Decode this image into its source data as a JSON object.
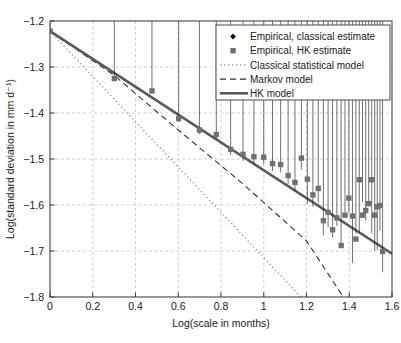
{
  "chart_data": {
    "type": "scatter",
    "title": "",
    "xlabel": "Log(scale in months)",
    "ylabel": "Log(standard deviation in mm d⁻¹)",
    "xlim": [
      0,
      1.6
    ],
    "ylim": [
      -1.8,
      -1.2
    ],
    "xticks": [
      "0",
      "0.2",
      "0.4",
      "0.6",
      "0.8",
      "1",
      "1.2",
      "1.4",
      "1.6"
    ],
    "xtick_values": [
      0,
      0.2,
      0.4,
      0.6,
      0.8,
      1.0,
      1.2,
      1.4,
      1.6
    ],
    "yticks": [
      "−1.2",
      "−1.3",
      "−1.4",
      "−1.5",
      "−1.6",
      "−1.7",
      "−1.8"
    ],
    "ytick_values": [
      -1.2,
      -1.3,
      -1.4,
      -1.5,
      -1.6,
      -1.7,
      -1.8
    ],
    "grid": true,
    "grid_style": "dashed",
    "grid_color": "#c8c8c8",
    "legend_position": "top-right",
    "series": [
      {
        "name": "Empirical, classical estimate",
        "type": "scatter",
        "marker": "diamond",
        "color": "#111111",
        "points": [
          [
            0.0,
            -1.222
          ],
          [
            0.301,
            -1.331
          ],
          [
            0.477,
            -1.362
          ],
          [
            0.602,
            -1.426
          ],
          [
            0.699,
            -1.453
          ],
          [
            0.778,
            -1.463
          ],
          [
            0.845,
            -1.498
          ],
          [
            0.903,
            -1.511
          ],
          [
            0.954,
            -1.517
          ],
          [
            1.0,
            -1.519
          ],
          [
            1.041,
            -1.533
          ],
          [
            1.079,
            -1.536
          ],
          [
            1.114,
            -1.561
          ],
          [
            1.146,
            -1.577
          ],
          [
            1.176,
            -1.53
          ],
          [
            1.204,
            -1.604
          ],
          [
            1.23,
            -1.611
          ],
          [
            1.255,
            -1.601
          ],
          [
            1.279,
            -1.673
          ],
          [
            1.301,
            -1.655
          ],
          [
            1.322,
            -1.677
          ],
          [
            1.342,
            -1.652
          ],
          [
            1.362,
            -1.695
          ],
          [
            1.38,
            -1.622
          ],
          [
            1.398,
            -1.624
          ],
          [
            1.415,
            -1.733
          ],
          [
            1.431,
            -1.668
          ],
          [
            1.447,
            -1.668
          ],
          [
            1.462,
            -1.599
          ],
          [
            1.477,
            -1.64
          ],
          [
            1.491,
            -1.598
          ],
          [
            1.505,
            -1.668
          ],
          [
            1.519,
            -1.707
          ],
          [
            1.531,
            -1.704
          ],
          [
            1.544,
            -1.663
          ],
          [
            1.556,
            -1.753
          ]
        ]
      },
      {
        "name": "Empirical, HK estimate",
        "type": "scatter",
        "marker": "square",
        "color": "#707070",
        "points": [
          [
            0.0,
            -1.222
          ],
          [
            0.301,
            -1.325
          ],
          [
            0.477,
            -1.352
          ],
          [
            0.602,
            -1.412
          ],
          [
            0.699,
            -1.437
          ],
          [
            0.778,
            -1.447
          ],
          [
            0.845,
            -1.479
          ],
          [
            0.903,
            -1.49
          ],
          [
            0.954,
            -1.495
          ],
          [
            1.0,
            -1.496
          ],
          [
            1.041,
            -1.51
          ],
          [
            1.079,
            -1.512
          ],
          [
            1.114,
            -1.536
          ],
          [
            1.146,
            -1.551
          ],
          [
            1.176,
            -1.498
          ],
          [
            1.204,
            -1.544
          ],
          [
            1.23,
            -1.578
          ],
          [
            1.255,
            -1.564
          ],
          [
            1.279,
            -1.634
          ],
          [
            1.301,
            -1.616
          ],
          [
            1.322,
            -1.654
          ],
          [
            1.342,
            -1.628
          ],
          [
            1.362,
            -1.688
          ],
          [
            1.38,
            -1.622
          ],
          [
            1.398,
            -1.585
          ],
          [
            1.415,
            -1.624
          ],
          [
            1.431,
            -1.674
          ],
          [
            1.447,
            -1.545
          ],
          [
            1.462,
            -1.622
          ],
          [
            1.477,
            -1.612
          ],
          [
            1.491,
            -1.597
          ],
          [
            1.505,
            -1.545
          ],
          [
            1.519,
            -1.622
          ],
          [
            1.531,
            -1.604
          ],
          [
            1.544,
            -1.601
          ],
          [
            1.556,
            -1.701
          ]
        ]
      },
      {
        "name": "Classical statistical model",
        "type": "line",
        "style": "dotted",
        "color": "#999999",
        "points": [
          [
            0.0,
            -1.222
          ],
          [
            1.174,
            -1.8
          ]
        ]
      },
      {
        "name": "Markov model",
        "type": "line",
        "style": "dashed",
        "color": "#333333",
        "points": [
          [
            0.0,
            -1.222
          ],
          [
            0.3,
            -1.318
          ],
          [
            0.6,
            -1.437
          ],
          [
            0.9,
            -1.553
          ],
          [
            1.2,
            -1.678
          ],
          [
            1.372,
            -1.8
          ]
        ]
      },
      {
        "name": "HK model",
        "type": "line",
        "style": "solid",
        "color": "#595959",
        "points": [
          [
            0.0,
            -1.222
          ],
          [
            1.6,
            -1.706
          ]
        ]
      }
    ]
  },
  "legend": {
    "entries": [
      {
        "label": "Empirical, classical estimate",
        "marker": "diamond"
      },
      {
        "label": "Empirical, HK estimate",
        "marker": "square"
      },
      {
        "label": "Classical statistical model",
        "marker": "dotted-line"
      },
      {
        "label": "Markov model",
        "marker": "dashed-line"
      },
      {
        "label": "HK model",
        "marker": "solid-line"
      }
    ]
  },
  "colors": {
    "diamond": "#111111",
    "square": "#707070",
    "dotted": "#999999",
    "dashed": "#333333",
    "solid": "#595959",
    "axis": "#444444",
    "grid": "#c8c8c8"
  }
}
